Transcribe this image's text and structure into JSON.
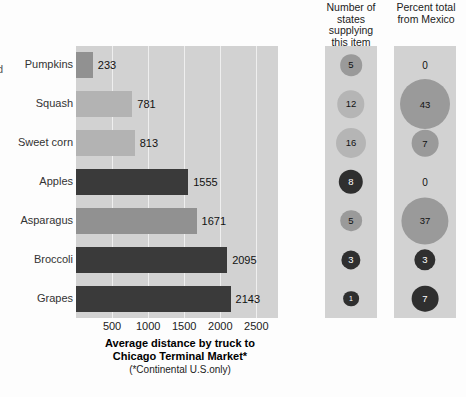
{
  "edge_glyph": "d",
  "chart_data": {
    "type": "bar",
    "subtitle": "(*Continental U.S.only)",
    "xlabel": "Average distance by truck to Chicago Terminal Market*",
    "ylabel": "",
    "xlim": [
      0,
      2800
    ],
    "xticks": [
      500,
      1000,
      1500,
      2000,
      2500
    ],
    "grid": true,
    "categories": [
      "Pumpkins",
      "Squash",
      "Sweet corn",
      "Apples",
      "Asparagus",
      "Broccoli",
      "Grapes"
    ],
    "values": [
      233,
      781,
      813,
      1555,
      1671,
      2095,
      2143
    ],
    "bar_shades": [
      "mid",
      "light",
      "light",
      "dark",
      "mid",
      "dark",
      "dark"
    ],
    "panels": [
      {
        "id": "states",
        "header": "Number of states supplying this item",
        "header_lines": [
          "Number of",
          "states",
          "supplying",
          "this item"
        ],
        "values": [
          5,
          12,
          16,
          8,
          5,
          3,
          1
        ],
        "shades": [
          "mid",
          "light",
          "light",
          "dark",
          "mid",
          "dark",
          "dark"
        ]
      },
      {
        "id": "mexico",
        "header": "Percent total from Mexico",
        "header_lines": [
          "Percent total",
          "from Mexico"
        ],
        "values": [
          0,
          43,
          7,
          0,
          37,
          3,
          7
        ],
        "shades": [
          "none",
          "mid",
          "mid",
          "none",
          "mid",
          "dark",
          "dark"
        ]
      }
    ],
    "colors": {
      "panel_bg": "#d2d2d2",
      "gridline": "#efefef",
      "bar_dark": "#3a3a3a",
      "bar_mid": "#919191",
      "bar_light": "#b3b3b3",
      "bubble_dark": "#2f2f2f",
      "bubble_mid": "#9a9a9a",
      "bubble_light": "#b5b5b5",
      "text": "#111111",
      "text_on_dark": "#ffffff"
    }
  }
}
